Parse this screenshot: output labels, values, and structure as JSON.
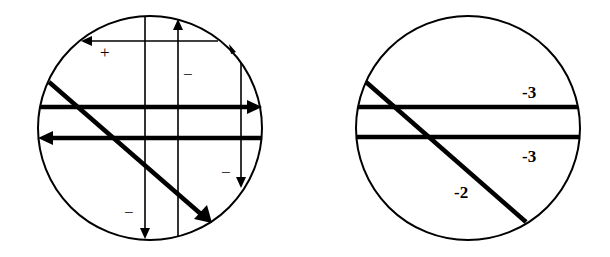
{
  "figure": {
    "left_panel": {
      "signs": {
        "top_loop": "+",
        "upper_vertical": "−",
        "right_vertical": "−",
        "bottom_left": "−"
      }
    },
    "right_panel": {
      "labels": {
        "upper_horizontal": "-3",
        "lower_horizontal": "-3",
        "diagonal": "-2"
      }
    }
  }
}
